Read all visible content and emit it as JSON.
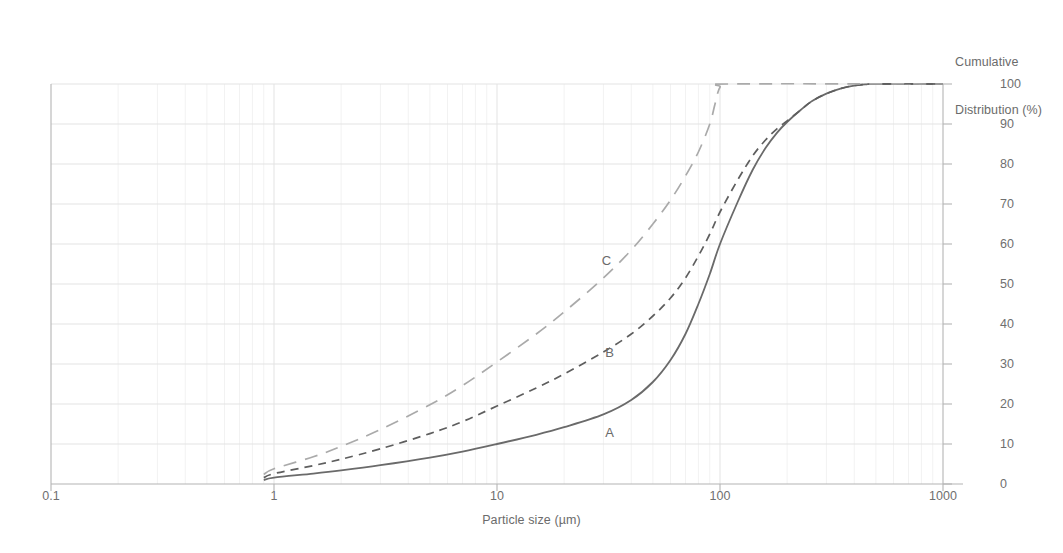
{
  "chart_data": {
    "type": "line",
    "title": "",
    "xlabel": "Particle size (µm)",
    "ylabel": "Cumulative\nDistribution (%)",
    "ylabel_line1": "Cumulative",
    "ylabel_line2": "Distribution (%)",
    "xscale": "log",
    "xlim": [
      0.1,
      1000
    ],
    "ylim": [
      0,
      100
    ],
    "xticks": [
      "0.1",
      "1",
      "10",
      "100",
      "1000"
    ],
    "xtick_values": [
      0.1,
      1,
      10,
      100,
      1000
    ],
    "yticks": [
      "0",
      "10",
      "20",
      "30",
      "40",
      "50",
      "60",
      "70",
      "80",
      "90",
      "100"
    ],
    "ytick_values": [
      0,
      10,
      20,
      30,
      40,
      50,
      60,
      70,
      80,
      90,
      100
    ],
    "y_axis_position": "right",
    "grid": true,
    "legend": "inline-labels",
    "series": [
      {
        "name": "A",
        "label": "A",
        "style": "solid",
        "color": "#6a6a6a",
        "label_x": 32,
        "label_y": 13,
        "points": [
          [
            0.9,
            1.0
          ],
          [
            1.0,
            1.6
          ],
          [
            1.5,
            2.6
          ],
          [
            2.0,
            3.4
          ],
          [
            3.0,
            4.7
          ],
          [
            5.0,
            6.6
          ],
          [
            7.0,
            8.1
          ],
          [
            10.0,
            10.0
          ],
          [
            15.0,
            12.3
          ],
          [
            20.0,
            14.2
          ],
          [
            30.0,
            17.4
          ],
          [
            40.0,
            21.0
          ],
          [
            50.0,
            25.5
          ],
          [
            60.0,
            31.0
          ],
          [
            70.0,
            37.5
          ],
          [
            80.0,
            45.0
          ],
          [
            90.0,
            52.5
          ],
          [
            100.0,
            60.0
          ],
          [
            120.0,
            70.5
          ],
          [
            140.0,
            78.5
          ],
          [
            160.0,
            84.0
          ],
          [
            180.0,
            87.8
          ],
          [
            200.0,
            90.5
          ],
          [
            230.0,
            93.5
          ],
          [
            260.0,
            95.8
          ],
          [
            300.0,
            97.6
          ],
          [
            350.0,
            98.9
          ],
          [
            400.0,
            99.6
          ],
          [
            450.0,
            99.9
          ],
          [
            500.0,
            100.0
          ],
          [
            1000.0,
            100.0
          ]
        ]
      },
      {
        "name": "B",
        "label": "B",
        "style": "dashed",
        "color": "#5e5e5e",
        "label_x": 32,
        "label_y": 33,
        "points": [
          [
            0.9,
            1.6
          ],
          [
            1.0,
            2.6
          ],
          [
            1.5,
            4.6
          ],
          [
            2.0,
            6.2
          ],
          [
            3.0,
            8.8
          ],
          [
            5.0,
            12.6
          ],
          [
            7.0,
            15.6
          ],
          [
            10.0,
            19.5
          ],
          [
            15.0,
            24.0
          ],
          [
            20.0,
            27.5
          ],
          [
            30.0,
            33.0
          ],
          [
            40.0,
            37.5
          ],
          [
            50.0,
            42.0
          ],
          [
            60.0,
            46.5
          ],
          [
            70.0,
            51.5
          ],
          [
            80.0,
            57.0
          ],
          [
            90.0,
            62.5
          ],
          [
            100.0,
            68.0
          ],
          [
            120.0,
            76.0
          ],
          [
            140.0,
            82.0
          ],
          [
            160.0,
            86.0
          ],
          [
            180.0,
            88.8
          ],
          [
            200.0,
            90.8
          ],
          [
            230.0,
            93.5
          ],
          [
            260.0,
            95.8
          ],
          [
            300.0,
            97.6
          ],
          [
            350.0,
            98.9
          ],
          [
            400.0,
            99.6
          ],
          [
            450.0,
            99.9
          ],
          [
            500.0,
            100.0
          ],
          [
            1000.0,
            100.0
          ]
        ]
      },
      {
        "name": "C",
        "label": "C",
        "style": "longdash",
        "color": "#aaaaaa",
        "label_x": 31,
        "label_y": 56,
        "points": [
          [
            0.9,
            2.4
          ],
          [
            1.0,
            3.8
          ],
          [
            1.5,
            6.8
          ],
          [
            2.0,
            9.4
          ],
          [
            3.0,
            13.6
          ],
          [
            5.0,
            19.8
          ],
          [
            7.0,
            24.6
          ],
          [
            10.0,
            30.5
          ],
          [
            15.0,
            37.5
          ],
          [
            20.0,
            43.0
          ],
          [
            30.0,
            51.5
          ],
          [
            40.0,
            58.5
          ],
          [
            50.0,
            65.0
          ],
          [
            60.0,
            71.0
          ],
          [
            70.0,
            77.0
          ],
          [
            80.0,
            83.0
          ],
          [
            90.0,
            90.0
          ],
          [
            95.0,
            95.0
          ],
          [
            100.0,
            99.2
          ],
          [
            110.0,
            100.0
          ],
          [
            1000.0,
            100.0
          ]
        ]
      }
    ]
  },
  "colors": {
    "grid_major": "#e3e3e3",
    "grid_minor": "#f2f2f2",
    "axis": "#b4b4b4",
    "text": "#6a6a6a",
    "background": "#ffffff"
  }
}
